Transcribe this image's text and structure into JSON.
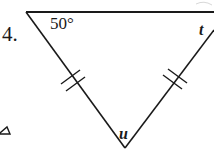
{
  "figure": {
    "problem_number": "4.",
    "labels": {
      "top_left_angle": "50°",
      "top_right_angle": "t",
      "bottom_angle": "u"
    },
    "shape": "isosceles-triangle",
    "congruence_marks": {
      "left_leg": "double-tick",
      "right_leg": "double-tick"
    },
    "colors": {
      "stroke": "#1a1a1a",
      "background": "#ffffff"
    }
  }
}
